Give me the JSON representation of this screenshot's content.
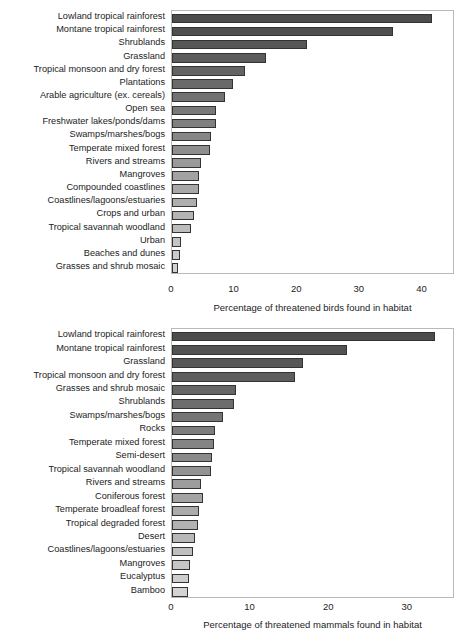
{
  "figure": {
    "width": 468,
    "height": 633,
    "background": "#ffffff"
  },
  "chart_data": [
    {
      "id": "birds",
      "type": "bar",
      "orientation": "horizontal",
      "title": "",
      "xlabel": "Percentage of threatened birds found in habitat",
      "ylabel": "",
      "xlim": [
        0,
        45.2
      ],
      "xticks": [
        0,
        10,
        20,
        30,
        40
      ],
      "xtick_labels": [
        "0",
        "10",
        "20",
        "30",
        "40"
      ],
      "grid": false,
      "legend": null,
      "bar_outline_color": "#33332f",
      "categories": [
        "Lowland tropical rainforest",
        "Montane tropical rainforest",
        "Shrublands",
        "Grassland",
        "Tropical monsoon and dry forest",
        "Plantations",
        "Arable agriculture (ex. cereals)",
        "Open sea",
        "Freshwater lakes/ponds/dams",
        "Swamps/marshes/bogs",
        "Temperate mixed forest",
        "Rivers and streams",
        "Mangroves",
        "Compounded coastlines",
        "Coastlines/lagoons/estuaries",
        "Crops and urban",
        "Tropical savannah woodland",
        "Urban",
        "Beaches and dunes",
        "Grasses and shrub mosaic"
      ],
      "values": [
        41.6,
        35.3,
        21.6,
        15.0,
        11.6,
        9.7,
        8.5,
        7.1,
        7.1,
        6.2,
        6.0,
        4.6,
        4.3,
        4.3,
        4.0,
        3.5,
        3.0,
        1.5,
        1.3,
        1.0
      ],
      "bar_colors": [
        "#4c4c4c",
        "#4f4f4f",
        "#565656",
        "#5c5c5c",
        "#636363",
        "#6a6a6a",
        "#727272",
        "#797979",
        "#808080",
        "#878787",
        "#8e8e8e",
        "#9a9a9a",
        "#a2a2a2",
        "#a8a8a8",
        "#aeaeae",
        "#b4b4b4",
        "#bcbcbc",
        "#c4c4c4",
        "#cbcbcb",
        "#d2d2d2"
      ]
    },
    {
      "id": "mammals",
      "type": "bar",
      "orientation": "horizontal",
      "title": "",
      "xlabel": "Percentage of threatened mammals found in habitat",
      "ylabel": "",
      "xlim": [
        0,
        36.0
      ],
      "xticks": [
        0,
        10,
        20,
        30
      ],
      "xtick_labels": [
        "0",
        "10",
        "20",
        "30"
      ],
      "grid": false,
      "legend": null,
      "bar_outline_color": "#33332f",
      "categories": [
        "Lowland tropical rainforest",
        "Montane tropical rainforest",
        "Grassland",
        "Tropical monsoon and dry forest",
        "Grasses and shrub mosaic",
        "Shrublands",
        "Swamps/marshes/bogs",
        "Rocks",
        "Temperate mixed forest",
        "Semi-desert",
        "Tropical savannah woodland",
        "Rivers and streams",
        "Coniferous forest",
        "Temperate broadleaf forest",
        "Tropical degraded forest",
        "Desert",
        "Coastlines/lagoons/estuaries",
        "Mangroves",
        "Eucalyptus",
        "Bamboo"
      ],
      "values": [
        33.5,
        22.3,
        16.7,
        15.6,
        8.2,
        7.9,
        6.5,
        5.5,
        5.3,
        5.1,
        4.9,
        3.7,
        3.9,
        3.4,
        3.3,
        2.9,
        2.7,
        2.3,
        2.2,
        2.0
      ],
      "bar_colors": [
        "#4c4c4c",
        "#525252",
        "#585858",
        "#5e5e5e",
        "#666666",
        "#6d6d6d",
        "#757575",
        "#7d7d7d",
        "#848484",
        "#8b8b8b",
        "#939393",
        "#9d9d9d",
        "#a4a4a4",
        "#ababab",
        "#b2b2b2",
        "#b8b8b8",
        "#bfbfbf",
        "#c6c6c6",
        "#cdcdcd",
        "#d4d4d4"
      ]
    }
  ]
}
